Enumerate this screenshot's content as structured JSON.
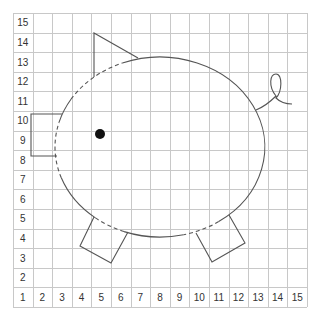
{
  "grid": {
    "columns": 15,
    "rows": 15,
    "origin_x": 13,
    "origin_y": 13,
    "cell": 19.6,
    "grid_color": "#c8c8c8",
    "row_labels": [
      "15",
      "14",
      "13",
      "12",
      "11",
      "10",
      "9",
      "8",
      "7",
      "6",
      "5",
      "4",
      "3",
      "2",
      "1"
    ],
    "column_labels": [
      "1",
      "2",
      "3",
      "4",
      "5",
      "6",
      "7",
      "8",
      "9",
      "10",
      "11",
      "12",
      "13",
      "14",
      "15"
    ]
  },
  "drawing": {
    "subject": "pig",
    "stroke_color": "#555555",
    "eye_color": "#111111",
    "body": {
      "cx": 160,
      "cy": 147,
      "rx": 105,
      "ry": 90
    },
    "eye": {
      "cx": 100,
      "cy": 134,
      "r": 5
    },
    "snout": {
      "points": "62,114 31,114 31,156 57,156"
    },
    "ear": {
      "points": "94,77 94,33 138,58"
    },
    "front_leg": {
      "points": "94,217 80,246 111,263 128,232"
    },
    "back_leg": {
      "points": "196,233 212,262 245,243 229,215"
    },
    "tail": {
      "path": "M256,110 C266,106 272,100 276,96 C268,86 270,74 276,74 C283,74 282,92 276,98 C280,102 286,104 292,104"
    }
  }
}
